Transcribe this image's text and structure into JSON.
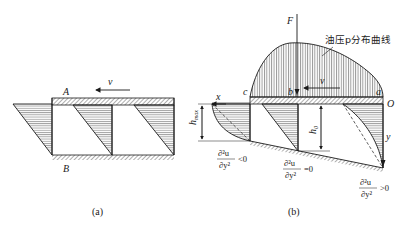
{
  "figure_a": {
    "caption": "(a)",
    "label_top": "A",
    "label_bottom": "B",
    "velocity_label": "v"
  },
  "figure_b": {
    "caption": "(b)",
    "force_label": "F",
    "pressure_curve_label": "油压p分布曲线",
    "point_c": "c",
    "point_b": "b",
    "point_a": "a",
    "origin_label": "O",
    "x_axis_label": "x",
    "y_axis_label": "y",
    "velocity_label": "v",
    "h_max_label": "h",
    "h_max_sub": "max",
    "h0_label": "h",
    "h0_sub": "0",
    "cond_left": {
      "num": "∂²u",
      "den": "∂y²",
      "rel": "<0"
    },
    "cond_mid": {
      "num": "∂²u",
      "den": "∂y²",
      "rel": "=0"
    },
    "cond_right": {
      "num": "∂²u",
      "den": "∂y²",
      "rel": ">0"
    }
  },
  "colors": {
    "line": "#1a1a1a",
    "hatch": "#555555",
    "background": "#ffffff"
  }
}
